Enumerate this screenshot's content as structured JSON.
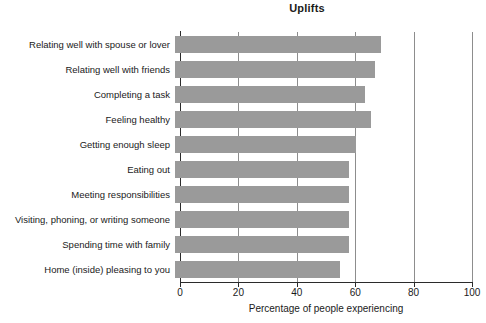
{
  "chart_data": {
    "type": "bar",
    "orientation": "horizontal",
    "title": "Uplifts",
    "xlabel": "Percentage of people experiencing",
    "ylabel": "",
    "xlim": [
      0,
      100
    ],
    "xticks": [
      0,
      20,
      40,
      60,
      80,
      100
    ],
    "xtick_labels": [
      "0",
      "20",
      "40",
      "60",
      "80",
      "100"
    ],
    "grid": "vertical",
    "legend": null,
    "bar_color": "#9a9a9a",
    "axis_color": "#2b2b2b",
    "categories": [
      "Relating well with spouse or lover",
      "Relating well with friends",
      "Completing a task",
      "Feeling healthy",
      "Getting enough sleep",
      "Eating out",
      "Meeting responsibilities",
      "Visiting, phoning, or writing someone",
      "Spending time with family",
      "Home (inside) pleasing to you"
    ],
    "values": [
      70.5,
      68.5,
      65,
      67,
      62,
      59.5,
      59.5,
      59.5,
      59.5,
      56.5
    ]
  }
}
